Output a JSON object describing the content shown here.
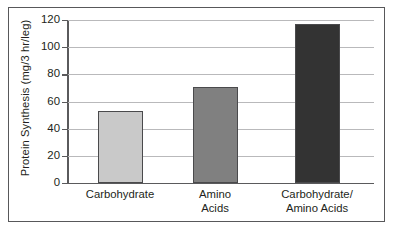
{
  "chart_data": {
    "type": "bar",
    "title": "",
    "xlabel": "",
    "ylabel": "Protein Synthesis (mg/3 hr/leg)",
    "categories": [
      "Carbohydrate",
      "Amino Acids",
      "Carbohydrate/ Amino Acids"
    ],
    "category_lines": [
      [
        "Carbohydrate"
      ],
      [
        "Amino",
        "Acids"
      ],
      [
        "Carbohydrate/",
        "Amino Acids"
      ]
    ],
    "values": [
      53,
      71,
      117
    ],
    "ylim": [
      0,
      120
    ],
    "yticks": [
      0,
      20,
      40,
      60,
      80,
      100,
      120
    ],
    "ytick_labels": [
      "0",
      "20",
      "40",
      "60",
      "80",
      "100",
      "120"
    ],
    "grid": true,
    "legend": "none",
    "bar_colors": [
      "#c9c9c9",
      "#808080",
      "#333333"
    ],
    "bar_edge_color": "#4a4a4c",
    "gridline_color": "#b9b9bb",
    "axis_color": "#5a5a5c",
    "frame_color": "#58585a",
    "text_color": "#231f20",
    "background": "#ffffff"
  }
}
